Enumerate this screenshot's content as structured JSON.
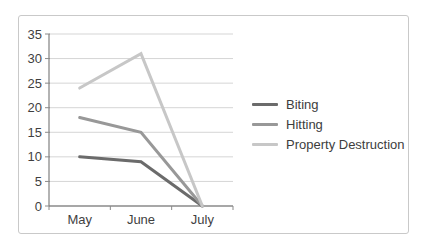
{
  "chart_data": {
    "type": "line",
    "title": "",
    "xlabel": "",
    "ylabel": "",
    "categories": [
      "May",
      "June",
      "July"
    ],
    "series": [
      {
        "name": "Biting",
        "values": [
          10,
          9,
          0
        ],
        "color": "#6b6b6b"
      },
      {
        "name": "Hitting",
        "values": [
          18,
          15,
          0
        ],
        "color": "#989898"
      },
      {
        "name": "Property Destruction",
        "values": [
          24,
          31,
          0
        ],
        "color": "#c7c7c7"
      }
    ],
    "ylim": [
      0,
      35
    ],
    "y_ticks": [
      0,
      5,
      10,
      15,
      20,
      25,
      30,
      35
    ],
    "grid": true,
    "legend_position": "right"
  },
  "colors": {
    "background": "#ffffff",
    "frame_border": "#c9c9c9",
    "gridline": "#d5d5d5",
    "axis": "#8a8a8a",
    "text": "#3f3f3f"
  }
}
